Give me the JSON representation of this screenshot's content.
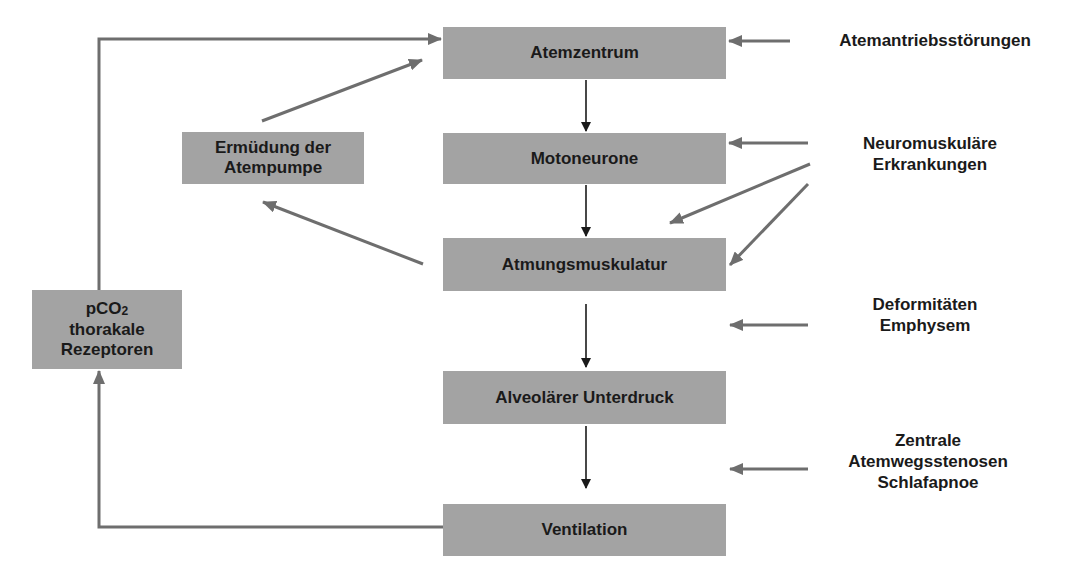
{
  "diagram": {
    "main_chain": [
      {
        "id": "atemzentrum",
        "label": "Atemzentrum"
      },
      {
        "id": "motoneurone",
        "label": "Motoneurone"
      },
      {
        "id": "atmungsmuskulatur",
        "label": "Atmungsmuskulatur"
      },
      {
        "id": "alveolaerer-unterdruck",
        "label": "Alveolärer Unterdruck"
      },
      {
        "id": "ventilation",
        "label": "Ventilation"
      }
    ],
    "side_boxes": {
      "ermuedung": {
        "line1": "Ermüdung der",
        "line2": "Atempumpe"
      },
      "rezeptoren": {
        "line1_main": "pCO",
        "line1_sub": "2",
        "line2": "thorakale",
        "line3": "Rezeptoren"
      }
    },
    "disorders": [
      {
        "id": "atemantrieb",
        "lines": [
          "Atemantriebsstörungen"
        ],
        "targets": [
          "Atemzentrum"
        ]
      },
      {
        "id": "neuromuskulaer",
        "lines": [
          "Neuromuskuläre",
          "Erkrankungen"
        ],
        "targets": [
          "Motoneurone",
          "Atmungsmuskulatur"
        ]
      },
      {
        "id": "deformitaeten",
        "lines": [
          "Deformitäten",
          "Emphysem"
        ],
        "targets": [
          "Atmungsmuskulatur → Alveolärer Unterdruck"
        ]
      },
      {
        "id": "atemwege",
        "lines": [
          "Zentrale",
          "Atemwegsstenosen",
          "Schlafapnoe"
        ],
        "targets": [
          "Alveolärer Unterdruck → Ventilation"
        ]
      }
    ],
    "colors": {
      "box_fill": "#a3a3a3",
      "text": "#1a1a1a",
      "chain_arrow": "#1a1a1a",
      "feedback_arrow": "#6e6e6e"
    }
  }
}
